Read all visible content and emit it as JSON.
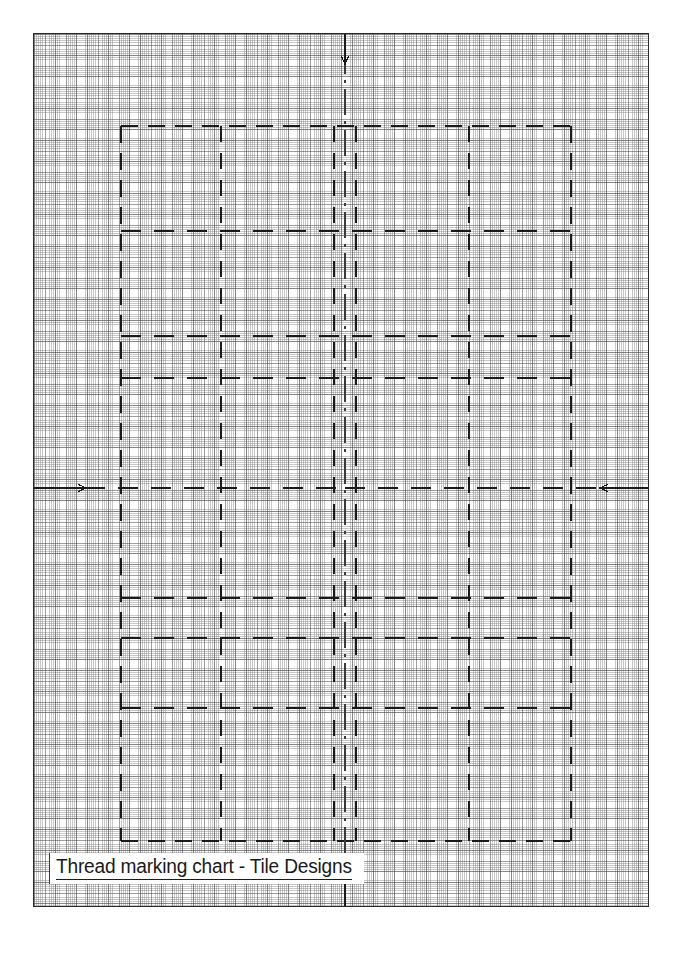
{
  "document": {
    "title": "Thread marking chart - Tile Designs",
    "medium": "engineering graph paper",
    "paper_color": "#fdfdfd",
    "border_color": "#2b2b2b",
    "ink_color": "#1a1a1a",
    "grid": {
      "minor_spacing_px": 2.12,
      "major_spacing_px": 10.6,
      "minor_color": "#787878",
      "major_color": "#505050"
    }
  },
  "drawing": {
    "description": "Technical layout of a 3x2 tile grid drawn in dashed construction lines with centre dash-dot axis and dimension arrows",
    "line_styles": {
      "dashed": "long dash",
      "dash_dot": "centre line dash-dot",
      "solid": "dimension arrow"
    },
    "outer_rectangle": {
      "x1": 87,
      "y1": 92,
      "x2": 537,
      "y2": 807
    },
    "vertical_lines": [
      {
        "name": "outer-left-edge",
        "x": 87,
        "y1": 92,
        "y2": 807,
        "style": "dashed"
      },
      {
        "name": "tile-divider-1",
        "x": 187,
        "y1": 92,
        "y2": 807,
        "style": "dashed"
      },
      {
        "name": "tile-divider-2",
        "x": 300,
        "y1": 92,
        "y2": 807,
        "style": "dashed"
      },
      {
        "name": "centre-axis",
        "x": 311,
        "y1": 12,
        "y2": 862,
        "style": "dash_dot"
      },
      {
        "name": "tile-divider-3",
        "x": 322,
        "y1": 92,
        "y2": 807,
        "style": "dashed"
      },
      {
        "name": "tile-divider-4",
        "x": 435,
        "y1": 92,
        "y2": 807,
        "style": "dashed"
      },
      {
        "name": "outer-right-edge",
        "x": 537,
        "y1": 92,
        "y2": 807,
        "style": "dashed"
      }
    ],
    "horizontal_lines": [
      {
        "name": "outer-top-edge",
        "y": 92,
        "x1": 87,
        "x2": 537,
        "style": "dashed"
      },
      {
        "name": "row-1-mid",
        "y": 197,
        "x1": 87,
        "x2": 537,
        "style": "dashed"
      },
      {
        "name": "row-1-bottom",
        "y": 302,
        "x1": 87,
        "x2": 537,
        "style": "dashed"
      },
      {
        "name": "row-2-top",
        "y": 344,
        "x1": 87,
        "x2": 537,
        "style": "dashed"
      },
      {
        "name": "centre-axis-horizontal",
        "y": 454,
        "x1": 0,
        "x2": 616,
        "style": "dashed"
      },
      {
        "name": "row-2-bottom",
        "y": 564,
        "x1": 87,
        "x2": 537,
        "style": "dashed"
      },
      {
        "name": "row-3-top",
        "y": 604,
        "x1": 87,
        "x2": 537,
        "style": "dashed"
      },
      {
        "name": "row-3-mid",
        "y": 674,
        "x1": 87,
        "x2": 537,
        "style": "dashed"
      },
      {
        "name": "outer-bottom-edge",
        "y": 807,
        "x1": 87,
        "x2": 537,
        "style": "dashed"
      }
    ],
    "arrows": [
      {
        "name": "top-dimension-arrow",
        "direction": "down",
        "x": 311,
        "from_y": 0,
        "to_y": 30
      },
      {
        "name": "left-dimension-arrow",
        "direction": "right",
        "y": 454,
        "from_x": -6,
        "to_x": 52
      },
      {
        "name": "right-dimension-arrow",
        "direction": "left",
        "y": 454,
        "from_x": 622,
        "to_x": 566
      },
      {
        "name": "bottom-dimension-arrow",
        "direction": "up",
        "x": 311,
        "from_y": 874,
        "to_y": 838
      }
    ]
  }
}
